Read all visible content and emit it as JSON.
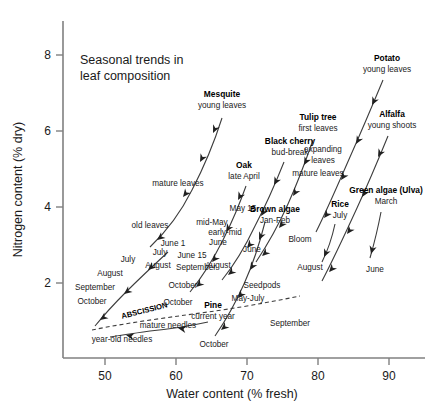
{
  "chart_data": {
    "type": "scatter",
    "title_line1": "Seasonal trends in",
    "title_line2": "leaf composition",
    "xlabel": "Water content (% fresh)",
    "ylabel": "Nitrogen content (% dry)",
    "xlim": [
      45,
      96
    ],
    "ylim": [
      0.35,
      8.9
    ],
    "xticks": [
      50,
      60,
      70,
      80,
      90
    ],
    "yticks": [
      2,
      4,
      6,
      8
    ],
    "grid": false,
    "legend": "none",
    "series": [
      {
        "name": "Mesquite",
        "label_bold": "Mesquite",
        "label_sub": "young leaves",
        "label_x": 222,
        "label_y": 97,
        "sub_x": 222,
        "sub_y": 108,
        "path": "M 222,118 C 215,140 205,165 192,190 C 182,210 168,230 150,247",
        "arrows": [
          {
            "x": 213,
            "y": 133,
            "angle": 115
          },
          {
            "x": 200,
            "y": 162,
            "angle": 118
          },
          {
            "x": 183,
            "y": 197,
            "angle": 128
          },
          {
            "x": 157,
            "y": 240,
            "angle": 142
          }
        ],
        "annotations": [
          {
            "text": "mature leaves",
            "x": 178,
            "y": 186,
            "anchor": "middle"
          },
          {
            "text": "old leaves",
            "x": 150,
            "y": 228,
            "anchor": "middle"
          }
        ]
      },
      {
        "name": "Oak",
        "label_bold": "Oak",
        "label_sub": "late April",
        "label_x": 244,
        "label_y": 168,
        "sub_x": 244,
        "sub_y": 179,
        "path": "M 246,186 C 240,203 232,222 223,240 C 214,258 203,276 190,292",
        "arrows": [
          {
            "x": 238,
            "y": 200,
            "angle": 118
          },
          {
            "x": 226,
            "y": 232,
            "angle": 122
          },
          {
            "x": 212,
            "y": 262,
            "angle": 130
          },
          {
            "x": 196,
            "y": 287,
            "angle": 140
          }
        ],
        "annotations": [
          {
            "text": "mid-May",
            "x": 212,
            "y": 225,
            "anchor": "middle"
          },
          {
            "text": "June 15",
            "x": 192,
            "y": 258,
            "anchor": "middle"
          },
          {
            "text": "September",
            "x": 196,
            "y": 270,
            "anchor": "middle"
          },
          {
            "text": "October",
            "x": 183,
            "y": 288,
            "anchor": "middle"
          }
        ]
      },
      {
        "name": "Black cherry",
        "label_bold": "Black cherry",
        "label_sub": "bud-break",
        "label_x": 290,
        "label_y": 144,
        "sub_x": 290,
        "sub_y": 155,
        "path": "M 284,162 C 276,182 266,205 255,226 C 246,245 235,264 222,280",
        "arrows": [
          {
            "x": 274,
            "y": 185,
            "angle": 118
          },
          {
            "x": 261,
            "y": 216,
            "angle": 122
          },
          {
            "x": 247,
            "y": 248,
            "angle": 130
          },
          {
            "x": 228,
            "y": 275,
            "angle": 140
          }
        ],
        "annotations": [
          {
            "text": "May 15",
            "x": 243,
            "y": 211,
            "anchor": "middle"
          },
          {
            "text": "early-mid",
            "x": 225,
            "y": 235,
            "anchor": "middle"
          },
          {
            "text": "June",
            "x": 218,
            "y": 245,
            "anchor": "middle"
          },
          {
            "text": "August",
            "x": 218,
            "y": 268,
            "anchor": "middle"
          }
        ]
      },
      {
        "name": "Tulip tree",
        "label_bold": "Tulip tree",
        "label_sub": "first leaves",
        "label_x": 318,
        "label_y": 120,
        "sub_x": 318,
        "sub_y": 131,
        "path": "M 313,140 C 306,160 298,182 288,204 C 279,224 268,244 256,262",
        "arrows": [
          {
            "x": 304,
            "y": 165,
            "angle": 118
          },
          {
            "x": 293,
            "y": 196,
            "angle": 122
          },
          {
            "x": 279,
            "y": 228,
            "angle": 128
          },
          {
            "x": 262,
            "y": 256,
            "angle": 138
          }
        ],
        "annotations": [
          {
            "text": "mature leaves",
            "x": 318,
            "y": 176,
            "anchor": "middle"
          },
          {
            "text": "June",
            "x": 252,
            "y": 252,
            "anchor": "middle"
          },
          {
            "text": "Seedpods",
            "x": 262,
            "y": 288,
            "anchor": "middle"
          },
          {
            "text": "May-July",
            "x": 248,
            "y": 301,
            "anchor": "middle"
          }
        ]
      },
      {
        "name": "Potato",
        "label_bold": "Potato",
        "label_sub": "young leaves",
        "label_x": 387,
        "label_y": 61,
        "sub_x": 387,
        "sub_y": 72,
        "path": "M 383,80 C 373,104 362,130 350,157 C 339,182 328,208 316,232",
        "arrows": [
          {
            "x": 372,
            "y": 105,
            "angle": 117
          },
          {
            "x": 356,
            "y": 144,
            "angle": 120
          },
          {
            "x": 341,
            "y": 180,
            "angle": 124
          },
          {
            "x": 324,
            "y": 218,
            "angle": 128
          }
        ],
        "annotations": [
          {
            "text": "expanding",
            "x": 323,
            "y": 152,
            "anchor": "middle"
          },
          {
            "text": "leaves",
            "x": 323,
            "y": 163,
            "anchor": "middle"
          }
        ]
      },
      {
        "name": "Alfalfa",
        "label_bold": "Alfalfa",
        "label_sub": "young shoots",
        "label_x": 392,
        "label_y": 117,
        "sub_x": 392,
        "sub_y": 128,
        "path": "M 388,136 C 379,158 369,182 357,208 C 346,232 334,258 322,281",
        "arrows": [
          {
            "x": 378,
            "y": 157,
            "angle": 118
          },
          {
            "x": 362,
            "y": 197,
            "angle": 122
          },
          {
            "x": 347,
            "y": 234,
            "angle": 126
          },
          {
            "x": 329,
            "y": 272,
            "angle": 132
          }
        ],
        "annotations": [
          {
            "text": "Bloom",
            "x": 300,
            "y": 242,
            "anchor": "middle"
          },
          {
            "text": "August",
            "x": 310,
            "y": 270,
            "anchor": "middle"
          },
          {
            "text": "September",
            "x": 290,
            "y": 326,
            "anchor": "middle"
          }
        ]
      },
      {
        "name": "Green algae (Ulva)",
        "label_bold": "Green algae (Ulva)",
        "label_sub": "March",
        "label_x": 386,
        "label_y": 193,
        "sub_x": 386,
        "sub_y": 204,
        "path": "M 381,212 C 378,228 374,244 370,258",
        "arrows": [
          {
            "x": 371,
            "y": 254,
            "angle": 105
          }
        ],
        "annotations": [
          {
            "text": "June",
            "x": 375,
            "y": 272,
            "anchor": "middle"
          }
        ]
      },
      {
        "name": "Rice",
        "label_bold": "Rice",
        "label_sub": "July",
        "label_x": 340,
        "label_y": 207,
        "sub_x": 340,
        "sub_y": 218,
        "path": "M 335,224 C 332,238 328,250 322,262",
        "arrows": [
          {
            "x": 324,
            "y": 257,
            "angle": 115
          }
        ],
        "annotations": []
      },
      {
        "name": "Brown algae",
        "label_bold": "Brown algae",
        "label_sub": "Jan-Feb",
        "label_x": 275,
        "label_y": 212,
        "sub_x": 275,
        "sub_y": 223,
        "path": "M 265,222 C 260,242 253,264 244,284 C 236,302 226,320 215,336",
        "arrows": [
          {
            "x": 259,
            "y": 240,
            "angle": 115
          },
          {
            "x": 250,
            "y": 270,
            "angle": 122
          },
          {
            "x": 238,
            "y": 298,
            "angle": 130
          },
          {
            "x": 221,
            "y": 330,
            "angle": 140
          }
        ],
        "annotations": []
      },
      {
        "name": "Pine",
        "label_bold": "Pine",
        "label_sub": "current year",
        "label_x": 213,
        "label_y": 308,
        "sub_x": 213,
        "sub_y": 319,
        "path": "M 208,322 C 190,326 170,329 150,331 C 136,333 122,335 110,337",
        "arrows": [
          {
            "x": 178,
            "y": 328,
            "angle": 190
          },
          {
            "x": 126,
            "y": 335,
            "angle": 192
          }
        ],
        "annotations": [
          {
            "text": "mature needles",
            "x": 168,
            "y": 328,
            "anchor": "middle"
          },
          {
            "text": "year-old needles",
            "x": 122,
            "y": 342,
            "anchor": "middle"
          },
          {
            "text": "October",
            "x": 214,
            "y": 347,
            "anchor": "middle"
          }
        ]
      },
      {
        "name": "Deciduous left series",
        "label_bold": "",
        "label_sub": "",
        "label_x": 0,
        "label_y": 0,
        "path": "M 168,252 C 155,264 140,278 126,292 C 115,303 104,315 95,326",
        "arrows": [
          {
            "x": 148,
            "y": 270,
            "angle": 140
          },
          {
            "x": 124,
            "y": 294,
            "angle": 142
          },
          {
            "x": 100,
            "y": 320,
            "angle": 144
          }
        ],
        "annotations": [
          {
            "text": "July",
            "x": 128,
            "y": 262,
            "anchor": "middle"
          },
          {
            "text": "August",
            "x": 110,
            "y": 276,
            "anchor": "middle"
          },
          {
            "text": "September",
            "x": 95,
            "y": 290,
            "anchor": "middle"
          },
          {
            "text": "October",
            "x": 92,
            "y": 304,
            "anchor": "middle"
          },
          {
            "text": "June 1",
            "x": 173,
            "y": 246,
            "anchor": "middle"
          },
          {
            "text": "July",
            "x": 160,
            "y": 255,
            "anchor": "middle"
          },
          {
            "text": "August",
            "x": 158,
            "y": 268,
            "anchor": "middle"
          },
          {
            "text": "October",
            "x": 178,
            "y": 305,
            "anchor": "middle"
          }
        ]
      }
    ],
    "abscission": {
      "label": "ABSCISSION",
      "label_x": 145,
      "label_y": 313,
      "label_rotate": -14,
      "path": "M 92,330 C 130,322 180,316 215,311 C 250,306 280,300 300,296"
    }
  }
}
